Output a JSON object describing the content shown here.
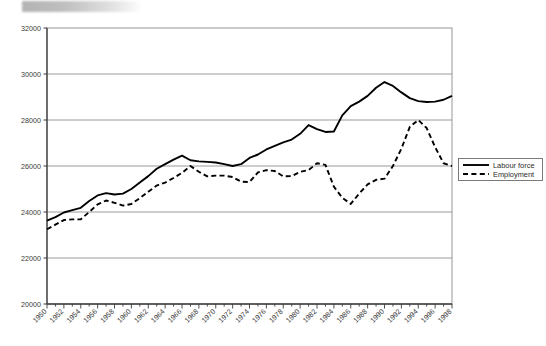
{
  "page": {
    "redaction_bar": "redacted-title-bar"
  },
  "legend": {
    "position": "right",
    "entries": [
      {
        "label": "Labour force",
        "style": "solid",
        "color": "#000000"
      },
      {
        "label": "Employment",
        "style": "dashed",
        "color": "#000000"
      }
    ]
  },
  "chart_data": {
    "type": "line",
    "title": "",
    "subtitle": "",
    "xlabel": "",
    "ylabel": "",
    "grid": true,
    "legend_position": "right",
    "ylim": [
      20000,
      32000
    ],
    "ytick_step": 2000,
    "yticks": [
      "20000",
      "22000",
      "24000",
      "26000",
      "28000",
      "30000",
      "32000"
    ],
    "xlim": [
      1950,
      1998
    ],
    "xtick_label_step": 2,
    "xtick_minor_step": 1,
    "x": [
      1950,
      1951,
      1952,
      1953,
      1954,
      1955,
      1956,
      1957,
      1958,
      1959,
      1960,
      1961,
      1962,
      1963,
      1964,
      1965,
      1966,
      1967,
      1968,
      1969,
      1970,
      1971,
      1972,
      1973,
      1974,
      1975,
      1976,
      1977,
      1978,
      1979,
      1980,
      1981,
      1982,
      1983,
      1984,
      1985,
      1986,
      1987,
      1988,
      1989,
      1990,
      1991,
      1992,
      1993,
      1994,
      1995,
      1996,
      1997,
      1998
    ],
    "xticklabels": [
      "1950",
      "1952",
      "1954",
      "1956",
      "1958",
      "1960",
      "1962",
      "1964",
      "1966",
      "1968",
      "1970",
      "1972",
      "1974",
      "1976",
      "1978",
      "1980",
      "1982",
      "1984",
      "1986",
      "1988",
      "1990",
      "1992",
      "1994",
      "1996",
      "1998"
    ],
    "series": [
      {
        "name": "Labour force",
        "style": "solid",
        "color": "#000000",
        "values": [
          23620,
          23780,
          23980,
          24080,
          24180,
          24480,
          24720,
          24820,
          24760,
          24800,
          25000,
          25280,
          25560,
          25880,
          26080,
          26280,
          26450,
          26250,
          26200,
          26180,
          26150,
          26080,
          26000,
          26080,
          26350,
          26500,
          26720,
          26880,
          27030,
          27150,
          27400,
          27780,
          27600,
          27480,
          27500,
          28200,
          28600,
          28800,
          29050,
          29400,
          29650,
          29480,
          29200,
          28950,
          28820,
          28780,
          28800,
          28880,
          29050
        ]
      },
      {
        "name": "Employment",
        "style": "dashed",
        "color": "#000000",
        "values": [
          23250,
          23450,
          23650,
          23680,
          23680,
          24000,
          24330,
          24500,
          24400,
          24280,
          24350,
          24600,
          24880,
          25150,
          25280,
          25480,
          25700,
          26000,
          25750,
          25550,
          25580,
          25580,
          25520,
          25320,
          25300,
          25720,
          25820,
          25780,
          25550,
          25560,
          25750,
          25820,
          26120,
          26050,
          25100,
          24620,
          24350,
          24800,
          25200,
          25400,
          25450,
          26000,
          26750,
          27700,
          28000,
          27650,
          26820,
          26120,
          26000
        ]
      }
    ],
    "series_alt_note": ""
  }
}
